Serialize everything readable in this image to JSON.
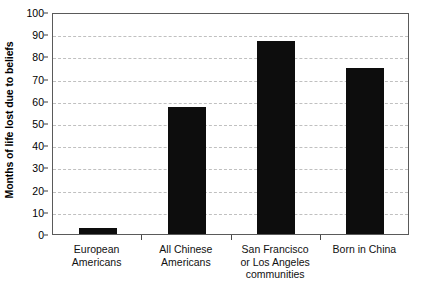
{
  "chart_data": {
    "type": "bar",
    "title": "",
    "xlabel": "",
    "ylabel": "Months of life lost due to beliefs",
    "categories": [
      "European\nAmericans",
      "All Chinese\nAmericans",
      "San Francisco\nor Los Angeles\ncommunities",
      "Born in China"
    ],
    "values": [
      2.5,
      57,
      87,
      75
    ],
    "ylim": [
      0,
      100
    ],
    "yticks": [
      0,
      10,
      20,
      30,
      40,
      50,
      60,
      70,
      80,
      90,
      100
    ],
    "ytick_labels": [
      "0",
      "10",
      "20",
      "30",
      "40",
      "50",
      "60",
      "70",
      "80",
      "90",
      "100"
    ],
    "grid": true,
    "grid_style": "dashed",
    "grid_axis": "y",
    "legend": false,
    "bar_color": "#0d0d0d",
    "grid_color": "#c0c0c0",
    "frame_color": "#5a5a5a",
    "background": "#ffffff"
  }
}
